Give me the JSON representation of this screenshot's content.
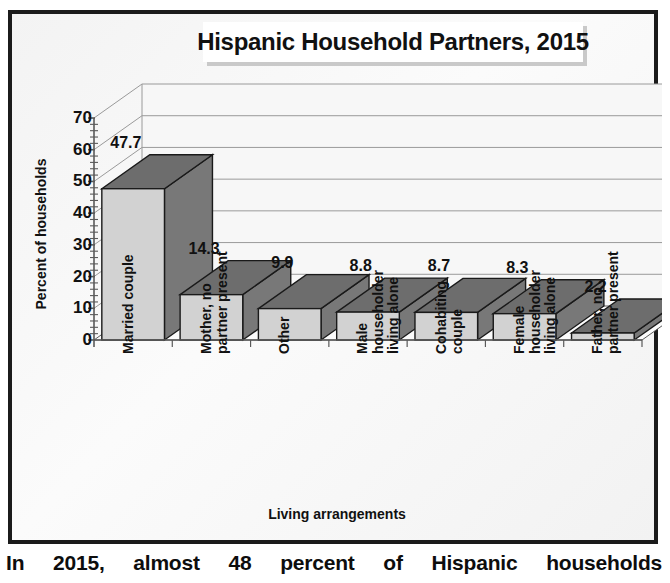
{
  "chart_data": {
    "type": "bar",
    "title": "Hispanic Household Partners, 2015",
    "xlabel": "Living arrangements",
    "ylabel": "Percent of households",
    "ylim": [
      0,
      70
    ],
    "ytick_step": 10,
    "yminor_step": 2,
    "grid": true,
    "legend": "none",
    "style": "3d-column",
    "categories": [
      "Married couple",
      "Mother, no partner present",
      "Other",
      "Male householder living alone",
      "Cohabiting couple",
      "Female householder living alone",
      "Father, no partner present"
    ],
    "category_lines": [
      [
        "Married couple"
      ],
      [
        "Mother, no",
        "partner present"
      ],
      [
        "Other"
      ],
      [
        "Male",
        "householder",
        "living alone"
      ],
      [
        "Cohabiting",
        "couple"
      ],
      [
        "Female",
        "householder",
        "living alone"
      ],
      [
        "Father, no",
        "partner present"
      ]
    ],
    "values": [
      47.7,
      14.3,
      9.9,
      8.8,
      8.7,
      8.3,
      2.2
    ],
    "value_labels": [
      "47.7",
      "14.3",
      "9.9",
      "8.8",
      "8.7",
      "8.3",
      "2.2"
    ],
    "ytick_labels": [
      "70",
      "60",
      "50",
      "40",
      "30",
      "20",
      "10",
      "0"
    ],
    "colors": {
      "bar_front": "#d2d2d2",
      "bar_top": "#6d6d6d",
      "bar_side": "#787878",
      "bar_outline": "#1a1a1a",
      "gridline": "#9a9a9a",
      "axis": "#5a5a5a",
      "plot_background": "#f7f7f7",
      "frame_border": "#1b1b1b",
      "text": "#111111",
      "title_box": "#ffffff",
      "title_shadow": "#c9c9c9"
    }
  },
  "caption": {
    "text": "In 2015, almost 48 percent of Hispanic households"
  }
}
